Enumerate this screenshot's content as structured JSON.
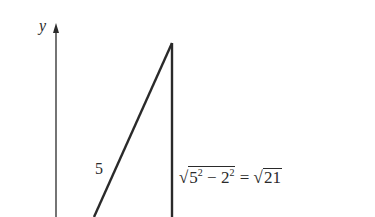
{
  "diagram": {
    "axis": {
      "label": "y"
    },
    "triangle": {
      "hypotenuse_label": "5",
      "vertical_side_label": {
        "sqrt_symbol": "√",
        "base1": "5",
        "exp1": "2",
        "minus": " − ",
        "base2": "2",
        "exp2": "2",
        "equals": " = ",
        "sqrt_symbol2": "√",
        "result": "21"
      }
    },
    "colors": {
      "line": "#2a2a2a",
      "background": "#ffffff"
    }
  }
}
